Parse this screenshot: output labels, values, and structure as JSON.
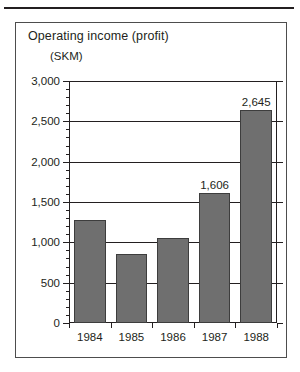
{
  "figure": {
    "title": "Operating income (profit)",
    "unit_label": "(SKM)"
  },
  "chart_data": {
    "type": "bar",
    "title": "Operating income (profit)",
    "xlabel": "",
    "ylabel": "(SKM)",
    "categories": [
      "1984",
      "1985",
      "1986",
      "1987",
      "1988"
    ],
    "values": [
      1280,
      860,
      1050,
      1606,
      2645
    ],
    "data_labels": [
      "",
      "",
      "",
      "1,606",
      "2,645"
    ],
    "ylim": [
      0,
      3000
    ],
    "ytick_labels": [
      "0",
      "500",
      "1,000",
      "1,500",
      "2,000",
      "2,500",
      "3,000"
    ],
    "ytick_values": [
      0,
      500,
      1000,
      1500,
      2000,
      2500,
      3000
    ],
    "ytick_minor_step": 100,
    "grid": true,
    "legend": "none",
    "bar_color": "#6f6f6f",
    "axis_color": "#231f20"
  }
}
